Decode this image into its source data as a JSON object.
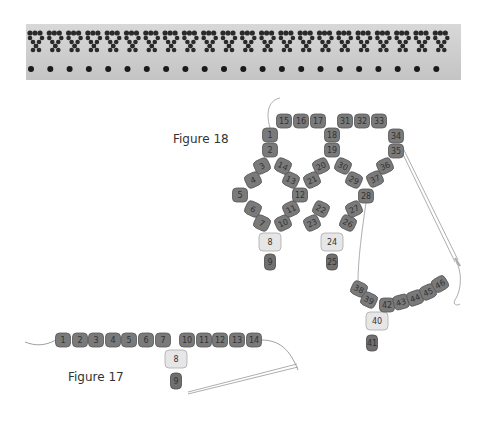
{
  "photo": {
    "alt": "beaded lace band sample",
    "colors": {
      "bead": "#2a2a2a",
      "background": "#cfcfcf"
    }
  },
  "figure18": {
    "caption": "Figure 18",
    "beads": [
      {
        "n": "1",
        "x": 270,
        "y": 135,
        "r": 0,
        "type": "dark"
      },
      {
        "n": "2",
        "x": 270,
        "y": 150,
        "r": 0,
        "type": "dark"
      },
      {
        "n": "3",
        "x": 262,
        "y": 166,
        "r": -25,
        "type": "dark"
      },
      {
        "n": "4",
        "x": 253,
        "y": 180,
        "r": -25,
        "type": "dark"
      },
      {
        "n": "5",
        "x": 240,
        "y": 195,
        "r": 0,
        "type": "dark"
      },
      {
        "n": "6",
        "x": 253,
        "y": 209,
        "r": 25,
        "type": "dark"
      },
      {
        "n": "7",
        "x": 262,
        "y": 223,
        "r": 25,
        "type": "dark"
      },
      {
        "n": "8",
        "x": 270,
        "y": 242,
        "r": 0,
        "type": "light"
      },
      {
        "n": "9",
        "x": 270,
        "y": 262,
        "r": 0,
        "type": "drop"
      },
      {
        "n": "10",
        "x": 283,
        "y": 223,
        "r": -25,
        "type": "dark"
      },
      {
        "n": "11",
        "x": 291,
        "y": 209,
        "r": -25,
        "type": "dark"
      },
      {
        "n": "12",
        "x": 300,
        "y": 195,
        "r": 0,
        "type": "dark"
      },
      {
        "n": "13",
        "x": 291,
        "y": 180,
        "r": 25,
        "type": "dark"
      },
      {
        "n": "14",
        "x": 283,
        "y": 166,
        "r": 25,
        "type": "dark"
      },
      {
        "n": "15",
        "x": 284,
        "y": 121,
        "r": 0,
        "type": "dark"
      },
      {
        "n": "16",
        "x": 301,
        "y": 121,
        "r": 0,
        "type": "dark"
      },
      {
        "n": "17",
        "x": 318,
        "y": 121,
        "r": 0,
        "type": "dark"
      },
      {
        "n": "18",
        "x": 332,
        "y": 135,
        "r": 0,
        "type": "dark"
      },
      {
        "n": "19",
        "x": 332,
        "y": 150,
        "r": 0,
        "type": "dark"
      },
      {
        "n": "20",
        "x": 321,
        "y": 166,
        "r": -25,
        "type": "dark"
      },
      {
        "n": "21",
        "x": 312,
        "y": 180,
        "r": -25,
        "type": "dark"
      },
      {
        "n": "22",
        "x": 321,
        "y": 209,
        "r": 25,
        "type": "dark"
      },
      {
        "n": "23",
        "x": 312,
        "y": 223,
        "r": -25,
        "type": "dark"
      },
      {
        "n": "24",
        "x": 332,
        "y": 242,
        "r": 0,
        "type": "light"
      },
      {
        "n": "25",
        "x": 332,
        "y": 262,
        "r": 0,
        "type": "drop"
      },
      {
        "n": "26",
        "x": 348,
        "y": 223,
        "r": 25,
        "type": "dark"
      },
      {
        "n": "27",
        "x": 354,
        "y": 209,
        "r": -25,
        "type": "dark"
      },
      {
        "n": "28",
        "x": 366,
        "y": 196,
        "r": 0,
        "type": "dark"
      },
      {
        "n": "29",
        "x": 354,
        "y": 180,
        "r": 25,
        "type": "dark"
      },
      {
        "n": "30",
        "x": 343,
        "y": 166,
        "r": 25,
        "type": "dark"
      },
      {
        "n": "31",
        "x": 345,
        "y": 121,
        "r": 0,
        "type": "dark"
      },
      {
        "n": "32",
        "x": 362,
        "y": 121,
        "r": 0,
        "type": "dark"
      },
      {
        "n": "33",
        "x": 379,
        "y": 121,
        "r": 0,
        "type": "dark"
      },
      {
        "n": "34",
        "x": 396,
        "y": 136,
        "r": 0,
        "type": "dark"
      },
      {
        "n": "35",
        "x": 396,
        "y": 151,
        "r": 0,
        "type": "dark"
      },
      {
        "n": "36",
        "x": 385,
        "y": 166,
        "r": -25,
        "type": "dark"
      },
      {
        "n": "37",
        "x": 375,
        "y": 179,
        "r": -25,
        "type": "dark"
      },
      {
        "n": "38",
        "x": 359,
        "y": 289,
        "r": 25,
        "type": "dark"
      },
      {
        "n": "39",
        "x": 369,
        "y": 300,
        "r": 25,
        "type": "dark"
      },
      {
        "n": "40",
        "x": 377,
        "y": 321,
        "r": 0,
        "type": "light"
      },
      {
        "n": "41",
        "x": 372,
        "y": 343,
        "r": 0,
        "type": "drop"
      },
      {
        "n": "42",
        "x": 387,
        "y": 305,
        "r": 0,
        "type": "dark"
      },
      {
        "n": "43",
        "x": 401,
        "y": 302,
        "r": -15,
        "type": "dark"
      },
      {
        "n": "44",
        "x": 415,
        "y": 298,
        "r": -20,
        "type": "dark"
      },
      {
        "n": "45",
        "x": 428,
        "y": 292,
        "r": -25,
        "type": "dark"
      },
      {
        "n": "46",
        "x": 440,
        "y": 284,
        "r": -30,
        "type": "dark"
      }
    ]
  },
  "figure17": {
    "caption": "Figure 17",
    "beads": [
      {
        "n": "1",
        "x": 63,
        "y": 340,
        "r": 0,
        "type": "dark"
      },
      {
        "n": "2",
        "x": 80,
        "y": 340,
        "r": 0,
        "type": "dark"
      },
      {
        "n": "3",
        "x": 96,
        "y": 340,
        "r": 0,
        "type": "dark"
      },
      {
        "n": "4",
        "x": 113,
        "y": 340,
        "r": 0,
        "type": "dark"
      },
      {
        "n": "5",
        "x": 129,
        "y": 340,
        "r": 0,
        "type": "dark"
      },
      {
        "n": "6",
        "x": 146,
        "y": 340,
        "r": 0,
        "type": "dark"
      },
      {
        "n": "7",
        "x": 163,
        "y": 340,
        "r": 0,
        "type": "dark"
      },
      {
        "n": "8",
        "x": 176,
        "y": 359,
        "r": 0,
        "type": "light"
      },
      {
        "n": "9",
        "x": 176,
        "y": 381,
        "r": 0,
        "type": "drop"
      },
      {
        "n": "10",
        "x": 187,
        "y": 340,
        "r": 0,
        "type": "dark"
      },
      {
        "n": "11",
        "x": 204,
        "y": 340,
        "r": 0,
        "type": "dark"
      },
      {
        "n": "12",
        "x": 220,
        "y": 340,
        "r": 0,
        "type": "dark"
      },
      {
        "n": "13",
        "x": 237,
        "y": 340,
        "r": 0,
        "type": "dark"
      },
      {
        "n": "14",
        "x": 254,
        "y": 340,
        "r": 0,
        "type": "dark"
      }
    ]
  },
  "colors": {
    "dark_bead": "#7a7a7a",
    "dark_bead_edge": "#555555",
    "light_bead": "#e6e6e6",
    "thread": "#888888"
  }
}
